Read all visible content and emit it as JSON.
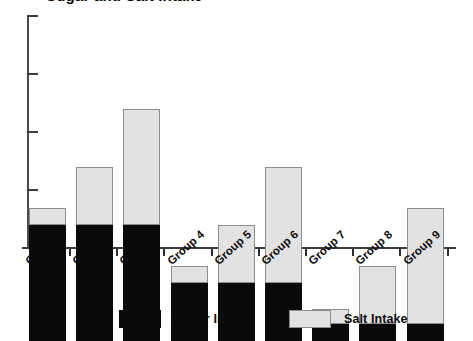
{
  "chart_data": {
    "type": "bar",
    "title": "Sugar and Salt Intake",
    "subtitle": "",
    "xlabel": "",
    "ylabel": "",
    "stacked": true,
    "grid": false,
    "legend_position": "bottom",
    "ylim": [
      0,
      4.05
    ],
    "y_ticks": [
      1,
      2,
      3,
      4
    ],
    "y_tick_labels": [
      "",
      "",
      "",
      ""
    ],
    "categories": [
      "Group 1",
      "Group 2",
      "Group 3",
      "Group 4",
      "Group 5",
      "Group 6",
      "Group 7",
      "Group 8",
      "Group 9"
    ],
    "series": [
      {
        "name": "Sugar Intake",
        "color": "#0a0a0a",
        "values": [
          2.0,
          2.0,
          2.0,
          1.0,
          1.0,
          1.0,
          0.3,
          0.3,
          0.3
        ]
      },
      {
        "name": "Salt Intake",
        "color": "#e2e2e2",
        "values": [
          0.3,
          1.0,
          2.0,
          0.3,
          1.0,
          2.0,
          0.25,
          1.0,
          2.0
        ]
      }
    ],
    "totals": [
      2.3,
      3.0,
      4.0,
      1.3,
      2.0,
      3.0,
      0.55,
      1.3,
      2.3
    ]
  },
  "legend": {
    "items": [
      {
        "label": "Sugar Intake",
        "swatch": "sugar"
      },
      {
        "label": "Salt Intake",
        "swatch": "salt"
      }
    ]
  }
}
